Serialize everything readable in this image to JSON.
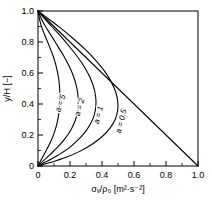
{
  "chart_data": {
    "type": "line",
    "title": "",
    "xlabel": "σᵥ/ρ₀  [m²·s⁻²]",
    "ylabel": "y/H  [−]",
    "xlim": [
      0.0,
      1.0
    ],
    "ylim": [
      0.0,
      1.0
    ],
    "grid": false,
    "legend_position": "inline-curve-labels",
    "xticks": [
      "0",
      "0.2",
      "0.4",
      "0.6",
      "0.8",
      "1.0"
    ],
    "xtick_values": [
      0.0,
      0.2,
      0.4,
      0.6,
      0.8,
      1.0
    ],
    "yticks": [
      "0",
      "0.2",
      "0.4",
      "0.6",
      "0.8",
      "1.0"
    ],
    "ytick_values": [
      0.0,
      0.2,
      0.4,
      0.6,
      0.8,
      1.0
    ],
    "xminor_step": 0.1,
    "yminor_step": 0.1,
    "series": [
      {
        "name": "a = 5",
        "label": "a = 5",
        "label_x": 0.155,
        "label_y": 0.4,
        "label_rotation": -72,
        "peak_x": 0.135,
        "peak_y": 0.46,
        "points_x": [
          0.0,
          0.021,
          0.046,
          0.072,
          0.095,
          0.113,
          0.126,
          0.134,
          0.137,
          0.135,
          0.129,
          0.118,
          0.104,
          0.086,
          0.064,
          0.04,
          0.02,
          0.008,
          0.0
        ],
        "points_y": [
          0.0,
          0.042,
          0.09,
          0.142,
          0.196,
          0.252,
          0.312,
          0.376,
          0.442,
          0.505,
          0.566,
          0.624,
          0.68,
          0.734,
          0.79,
          0.85,
          0.906,
          0.955,
          1.0
        ]
      },
      {
        "name": "a = 2",
        "label": "a = 2",
        "label_x": 0.275,
        "label_y": 0.375,
        "label_rotation": -74,
        "peak_x": 0.252,
        "peak_y": 0.4,
        "points_x": [
          0.0,
          0.036,
          0.08,
          0.127,
          0.17,
          0.206,
          0.232,
          0.248,
          0.252,
          0.248,
          0.236,
          0.217,
          0.192,
          0.161,
          0.124,
          0.085,
          0.048,
          0.02,
          0.0
        ],
        "points_y": [
          0.0,
          0.036,
          0.078,
          0.126,
          0.178,
          0.234,
          0.292,
          0.352,
          0.412,
          0.472,
          0.532,
          0.592,
          0.65,
          0.71,
          0.772,
          0.838,
          0.898,
          0.952,
          1.0
        ]
      },
      {
        "name": "a = 1",
        "label": "a = 1",
        "label_x": 0.393,
        "label_y": 0.325,
        "label_rotation": -75,
        "peak_x": 0.362,
        "peak_y": 0.335,
        "points_x": [
          0.0,
          0.056,
          0.122,
          0.188,
          0.244,
          0.292,
          0.328,
          0.352,
          0.362,
          0.36,
          0.347,
          0.324,
          0.292,
          0.25,
          0.2,
          0.143,
          0.086,
          0.038,
          0.0
        ],
        "points_y": [
          0.0,
          0.03,
          0.068,
          0.112,
          0.162,
          0.215,
          0.272,
          0.33,
          0.39,
          0.45,
          0.512,
          0.574,
          0.636,
          0.7,
          0.766,
          0.836,
          0.9,
          0.954,
          1.0
        ]
      },
      {
        "name": "a = 0.5",
        "label": "a = 0.5",
        "label_x": 0.535,
        "label_y": 0.285,
        "label_rotation": -76,
        "peak_x": 0.498,
        "peak_y": 0.255,
        "points_x": [
          0.0,
          0.082,
          0.175,
          0.264,
          0.34,
          0.403,
          0.451,
          0.483,
          0.498,
          0.498,
          0.484,
          0.456,
          0.416,
          0.362,
          0.295,
          0.216,
          0.134,
          0.062,
          0.0
        ],
        "points_y": [
          0.0,
          0.024,
          0.056,
          0.096,
          0.142,
          0.192,
          0.246,
          0.302,
          0.36,
          0.42,
          0.482,
          0.546,
          0.612,
          0.68,
          0.752,
          0.826,
          0.896,
          0.952,
          1.0
        ]
      },
      {
        "name": "linear-reference",
        "label": "",
        "points_x": [
          0.0,
          1.0
        ],
        "points_y": [
          1.0,
          0.0
        ]
      }
    ]
  }
}
